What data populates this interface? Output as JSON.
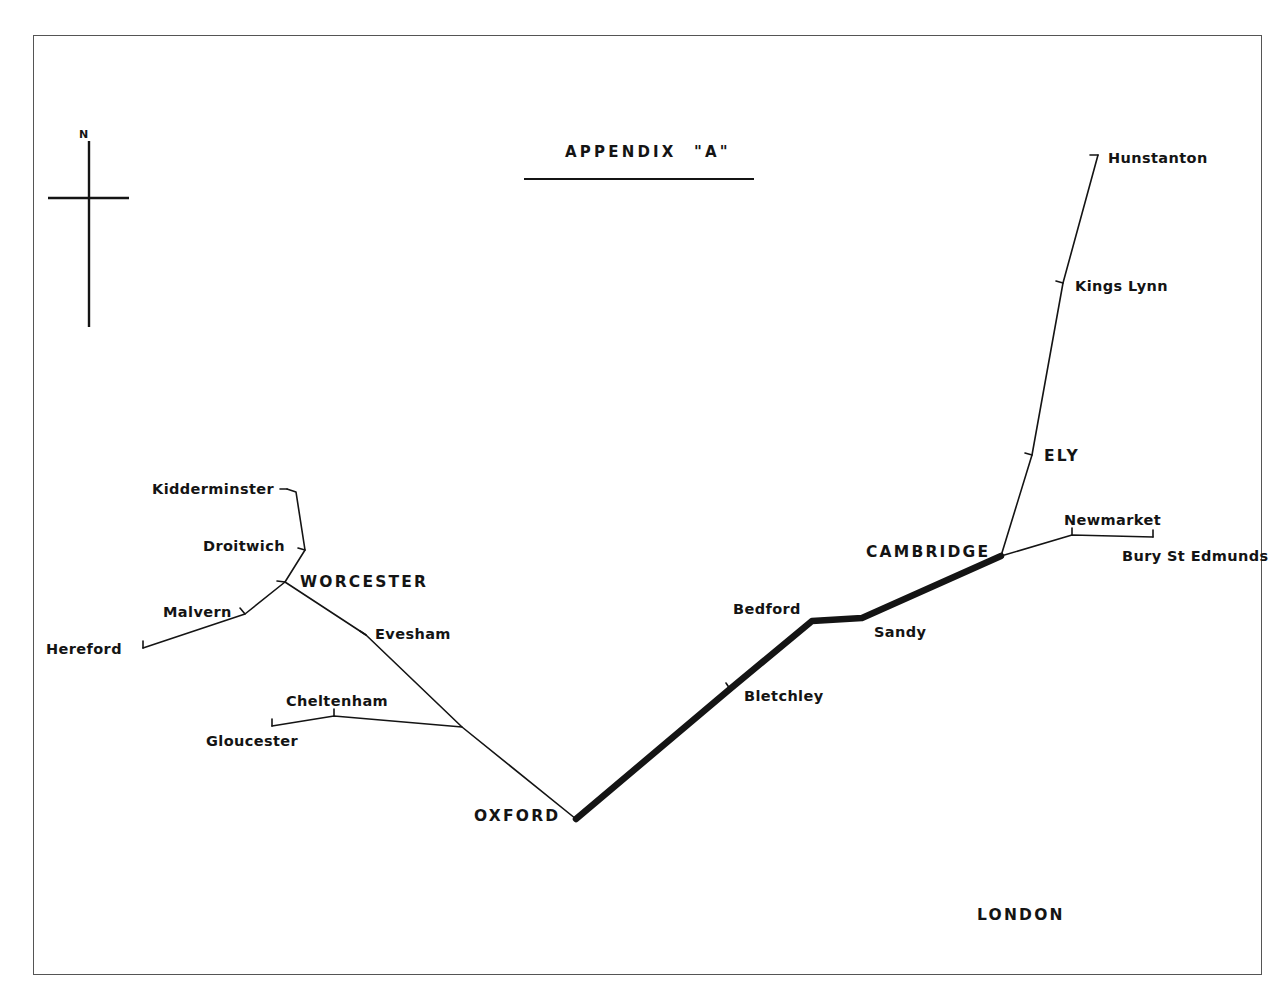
{
  "document": {
    "title": "APPENDIX",
    "title_suffix": "\"A\"",
    "sheet_kind": "hand-drawn railway route diagram"
  },
  "compass": {
    "north_label": "N"
  },
  "map": {
    "line_color": "#141414",
    "background_color": "#ffffff",
    "border_color": "#555555",
    "thick_route_note": "Oxford - Bletchley - Bedford - Sandy - Cambridge shown as heavy line",
    "stations": [
      {
        "id": "hunstanton",
        "label": "Hunstanton",
        "emphasis": "minor",
        "x": 1098,
        "y": 155,
        "label_x": 1108,
        "label_y": 150,
        "anchor": "start",
        "tick": true
      },
      {
        "id": "kings-lynn",
        "label": "Kings Lynn",
        "emphasis": "minor",
        "x": 1063,
        "y": 283,
        "label_x": 1075,
        "label_y": 278,
        "anchor": "start",
        "tick": true
      },
      {
        "id": "ely",
        "label": "ELY",
        "emphasis": "major",
        "x": 1032,
        "y": 455,
        "label_x": 1044,
        "label_y": 447,
        "anchor": "start",
        "tick": true
      },
      {
        "id": "newmarket",
        "label": "Newmarket",
        "emphasis": "minor",
        "x": 1072,
        "y": 535,
        "label_x": 1064,
        "label_y": 512,
        "anchor": "start",
        "tick": true
      },
      {
        "id": "bury-st-edmunds",
        "label": "Bury St Edmunds",
        "emphasis": "minor",
        "x": 1153,
        "y": 537,
        "label_x": 1122,
        "label_y": 548,
        "anchor": "start",
        "tick": true
      },
      {
        "id": "cambridge",
        "label": "CAMBRIDGE",
        "emphasis": "major",
        "x": 1001,
        "y": 556,
        "label_x": 866,
        "label_y": 543,
        "anchor": "start",
        "tick": false
      },
      {
        "id": "sandy",
        "label": "Sandy",
        "emphasis": "minor",
        "x": 862,
        "y": 618,
        "label_x": 874,
        "label_y": 624,
        "anchor": "start",
        "tick": false
      },
      {
        "id": "bedford",
        "label": "Bedford",
        "emphasis": "minor",
        "x": 812,
        "y": 621,
        "label_x": 733,
        "label_y": 601,
        "anchor": "start",
        "tick": false
      },
      {
        "id": "bletchley",
        "label": "Bletchley",
        "emphasis": "minor",
        "x": 730,
        "y": 689,
        "label_x": 744,
        "label_y": 688,
        "anchor": "start",
        "tick": true
      },
      {
        "id": "oxford",
        "label": "OXFORD",
        "emphasis": "major",
        "x": 576,
        "y": 819,
        "label_x": 474,
        "label_y": 807,
        "anchor": "start",
        "tick": false
      },
      {
        "id": "cheltenham",
        "label": "Cheltenham",
        "emphasis": "minor",
        "x": 334,
        "y": 716,
        "label_x": 286,
        "label_y": 693,
        "anchor": "start",
        "tick": true
      },
      {
        "id": "gloucester",
        "label": "Gloucester",
        "emphasis": "minor",
        "x": 272,
        "y": 726,
        "label_x": 206,
        "label_y": 733,
        "anchor": "start",
        "tick": true
      },
      {
        "id": "evesham",
        "label": "Evesham",
        "emphasis": "minor",
        "x": 366,
        "y": 635,
        "label_x": 375,
        "label_y": 626,
        "anchor": "start",
        "tick": true
      },
      {
        "id": "worcester",
        "label": "WORCESTER",
        "emphasis": "major",
        "x": 285,
        "y": 582,
        "label_x": 300,
        "label_y": 573,
        "anchor": "start",
        "tick": true
      },
      {
        "id": "droitwich",
        "label": "Droitwich",
        "emphasis": "minor",
        "x": 305,
        "y": 550,
        "label_x": 203,
        "label_y": 538,
        "anchor": "start",
        "tick": true
      },
      {
        "id": "kidderminster",
        "label": "Kidderminster",
        "emphasis": "minor",
        "x": 287,
        "y": 489,
        "label_x": 152,
        "label_y": 481,
        "anchor": "start",
        "tick": true
      },
      {
        "id": "malvern",
        "label": "Malvern",
        "emphasis": "minor",
        "x": 245,
        "y": 614,
        "label_x": 163,
        "label_y": 604,
        "anchor": "start",
        "tick": true
      },
      {
        "id": "hereford",
        "label": "Hereford",
        "emphasis": "minor",
        "x": 143,
        "y": 648,
        "label_x": 46,
        "label_y": 641,
        "anchor": "start",
        "tick": true
      },
      {
        "id": "london",
        "label": "LONDON",
        "emphasis": "major",
        "x": null,
        "y": null,
        "label_x": 977,
        "label_y": 906,
        "anchor": "start",
        "tick": false
      }
    ],
    "routes": [
      {
        "id": "route-kidderminster-worcester",
        "weight": "thin",
        "points": [
          [
            287,
            489
          ],
          [
            296,
            492
          ],
          [
            305,
            550
          ],
          [
            285,
            582
          ]
        ]
      },
      {
        "id": "route-hereford-malvern-worcester",
        "weight": "thin",
        "points": [
          [
            143,
            648
          ],
          [
            245,
            614
          ],
          [
            285,
            582
          ]
        ]
      },
      {
        "id": "route-worcester-evesham-oxford",
        "weight": "thin",
        "points": [
          [
            285,
            582
          ],
          [
            366,
            635
          ],
          [
            462,
            727
          ],
          [
            576,
            819
          ]
        ]
      },
      {
        "id": "route-gloucester-cheltenham-junction",
        "weight": "thin",
        "points": [
          [
            272,
            726
          ],
          [
            334,
            716
          ],
          [
            462,
            727
          ]
        ]
      },
      {
        "id": "route-oxford-bletchley-bedford-sandy-cambridge",
        "weight": "thick",
        "points": [
          [
            576,
            819
          ],
          [
            730,
            689
          ],
          [
            812,
            621
          ],
          [
            862,
            618
          ],
          [
            1001,
            556
          ]
        ]
      },
      {
        "id": "route-cambridge-ely-kings-lynn-hunstanton",
        "weight": "thin",
        "points": [
          [
            1001,
            556
          ],
          [
            1032,
            455
          ],
          [
            1063,
            283
          ],
          [
            1098,
            155
          ]
        ]
      },
      {
        "id": "route-cambridge-newmarket-bury",
        "weight": "thin",
        "points": [
          [
            1001,
            556
          ],
          [
            1072,
            535
          ],
          [
            1153,
            537
          ]
        ]
      }
    ]
  }
}
